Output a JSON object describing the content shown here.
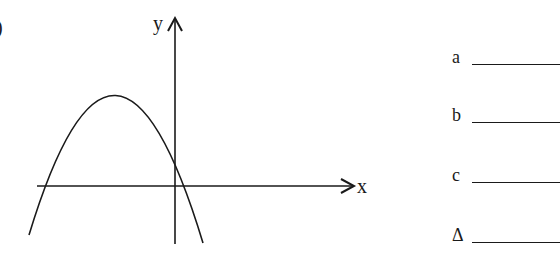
{
  "question_number_fragment": ")",
  "graph": {
    "x_axis_label": "x",
    "y_axis_label": "y",
    "curve": "downward-opening parabola",
    "vertex_position": "left of y-axis, above x-axis",
    "y_intercept": "positive",
    "x_intercepts": "one negative, one positive"
  },
  "answers": [
    {
      "label": "a",
      "value": ""
    },
    {
      "label": "b",
      "value": ""
    },
    {
      "label": "c",
      "value": ""
    },
    {
      "label": "Δ",
      "value": ""
    }
  ],
  "colors": {
    "ink": "#1a1a1a",
    "background": "#ffffff"
  }
}
